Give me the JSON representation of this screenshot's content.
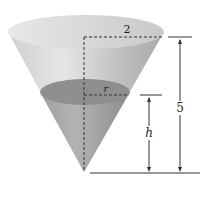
{
  "diagram": {
    "type": "inverted-cone-with-liquid",
    "labels": {
      "top_radius": "2",
      "liquid_radius": "r",
      "liquid_height": "h",
      "total_height": "5"
    },
    "colors": {
      "cone_light": "#d9d9d9",
      "cone_mid": "#b8b8b8",
      "liquid": "#9a9a9a",
      "liquid_top": "#8a8a8a",
      "line": "#333333"
    }
  }
}
